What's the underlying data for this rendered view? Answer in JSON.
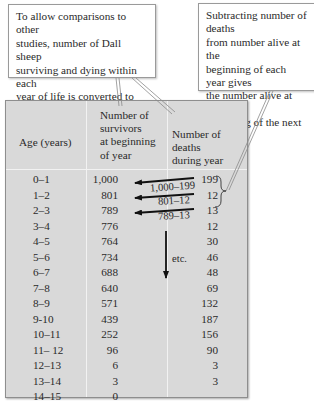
{
  "callouts": {
    "left": [
      "To allow comparisons to other",
      "studies, number of Dall sheep",
      "surviving and dying within each",
      "year of life is converted to",
      "numbers per 1,000 births."
    ],
    "right": [
      "Subtracting number of deaths",
      "from number alive at the",
      "beginning of each year gives",
      "the number alive at the",
      "beginning of the next year."
    ]
  },
  "table": {
    "headers": {
      "age": "Age (years)",
      "survivors": [
        "Number of",
        "survivors",
        "at beginning",
        "of year"
      ],
      "deaths": [
        "Number of deaths",
        "during year"
      ]
    },
    "rows": [
      {
        "age": "0–1",
        "survivors": "1,000",
        "deaths": "199"
      },
      {
        "age": "1–2",
        "survivors": "801",
        "deaths": "12"
      },
      {
        "age": "2–3",
        "survivors": "789",
        "deaths": "13"
      },
      {
        "age": "3–4",
        "survivors": "776",
        "deaths": "12"
      },
      {
        "age": "4–5",
        "survivors": "764",
        "deaths": "30"
      },
      {
        "age": "5–6",
        "survivors": "734",
        "deaths": "46"
      },
      {
        "age": "6–7",
        "survivors": "688",
        "deaths": "48"
      },
      {
        "age": "7–8",
        "survivors": "640",
        "deaths": "69"
      },
      {
        "age": "8–9",
        "survivors": "571",
        "deaths": "132"
      },
      {
        "age": "9-10",
        "survivors": "439",
        "deaths": "187"
      },
      {
        "age": "10–11",
        "survivors": "252",
        "deaths": "156"
      },
      {
        "age": "11– 12",
        "survivors": "96",
        "deaths": "90"
      },
      {
        "age": "12–13",
        "survivors": "6",
        "deaths": "3"
      },
      {
        "age": "13–14",
        "survivors": "3",
        "deaths": "3"
      },
      {
        "age": "14–15",
        "survivors": "0",
        "deaths": ""
      }
    ]
  },
  "annotations": {
    "calc1": "1,000–199",
    "calc2": "801–12",
    "calc3": "789–13",
    "etc": "etc."
  },
  "colors": {
    "table_bg": "#d9d9d9",
    "divider": "#f2f2f2",
    "text": "#2a2a2a"
  }
}
